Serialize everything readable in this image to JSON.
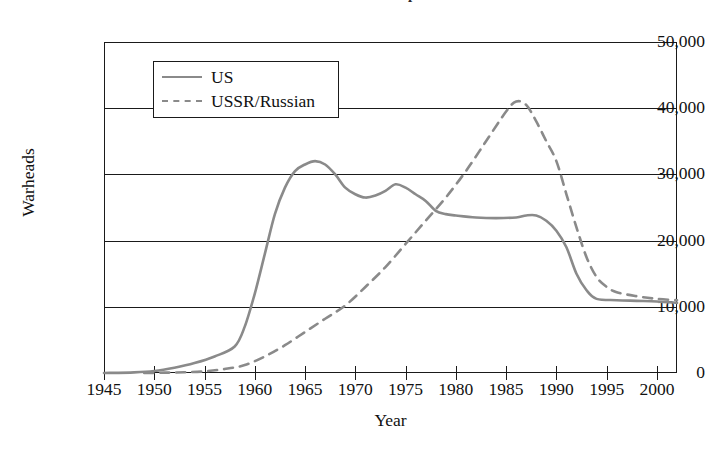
{
  "chart_data": {
    "type": "line",
    "title": "Global Nuclear Stockpiles",
    "xlabel": "Year",
    "ylabel": "Warheads",
    "xlim": [
      1945,
      2002
    ],
    "ylim": [
      0,
      50000
    ],
    "grid": true,
    "legend_position": "top-left-inside",
    "xticks": [
      1945,
      1950,
      1955,
      1960,
      1965,
      1970,
      1975,
      1980,
      1985,
      1990,
      1995,
      2000
    ],
    "xtick_labels": [
      "1945",
      "1950",
      "1955",
      "1960",
      "1965",
      "1970",
      "1975",
      "1980",
      "1985",
      "1990",
      "1995",
      "2000"
    ],
    "yticks": [
      0,
      10000,
      20000,
      30000,
      40000,
      50000
    ],
    "ytick_labels": [
      "0",
      "10,000",
      "20,000",
      "30,000",
      "40,000",
      "50,000"
    ],
    "series": [
      {
        "name": "US",
        "style": "solid",
        "color": "#8a8a8a",
        "x": [
          1945,
          1948,
          1950,
          1952,
          1954,
          1956,
          1958,
          1959,
          1960,
          1961,
          1962,
          1963,
          1964,
          1965,
          1966,
          1967,
          1968,
          1969,
          1970,
          1971,
          1972,
          1973,
          1974,
          1975,
          1976,
          1977,
          1978,
          1979,
          1980,
          1982,
          1984,
          1986,
          1987,
          1988,
          1989,
          1990,
          1991,
          1992,
          1993,
          1994,
          1996,
          1998,
          2000,
          2002
        ],
        "y": [
          0,
          100,
          300,
          800,
          1500,
          2500,
          4000,
          7000,
          12000,
          18000,
          24000,
          28000,
          30500,
          31500,
          32000,
          31500,
          30000,
          28000,
          27000,
          26500,
          26800,
          27500,
          28500,
          28000,
          27000,
          26000,
          24500,
          24000,
          23800,
          23500,
          23400,
          23500,
          23800,
          23800,
          23000,
          21500,
          19000,
          15000,
          12500,
          11200,
          11000,
          10900,
          10800,
          10600
        ]
      },
      {
        "name": "USSR/Russian",
        "style": "dashed",
        "color": "#8a8a8a",
        "x": [
          1949,
          1951,
          1953,
          1955,
          1957,
          1959,
          1961,
          1963,
          1965,
          1967,
          1969,
          1971,
          1973,
          1975,
          1977,
          1979,
          1981,
          1983,
          1985,
          1986,
          1987,
          1988,
          1989,
          1990,
          1991,
          1992,
          1993,
          1994,
          1995,
          1996,
          1998,
          2000,
          2002
        ],
        "y": [
          0,
          50,
          120,
          250,
          600,
          1200,
          2500,
          4200,
          6200,
          8200,
          10200,
          13000,
          16000,
          19500,
          23000,
          26500,
          30500,
          35000,
          39500,
          41000,
          40500,
          38000,
          35000,
          32000,
          27000,
          22000,
          17500,
          14500,
          13000,
          12200,
          11600,
          11200,
          11000
        ]
      }
    ]
  },
  "axes": {
    "y_title": "Warheads",
    "x_title": "Year"
  },
  "legend": {
    "entries": [
      {
        "label": "US",
        "style": "solid"
      },
      {
        "label": "USSR/Russian",
        "style": "dashed"
      }
    ]
  }
}
